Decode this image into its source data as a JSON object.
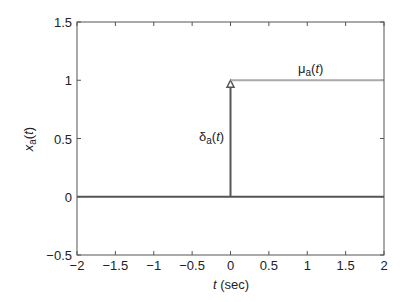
{
  "chart_data": {
    "type": "line",
    "title": "",
    "xlabel": "t (sec)",
    "xlabel_italic_part": "t",
    "xlabel_unit": " (sec)",
    "ylabel": "x_a(t)",
    "xlim": [
      -2,
      2
    ],
    "ylim": [
      -0.5,
      1.5
    ],
    "grid": false,
    "legend": null,
    "xticks": [
      -2,
      -1.5,
      -1,
      -0.5,
      0,
      0.5,
      1,
      1.5,
      2
    ],
    "xtick_labels": [
      "−2",
      "−1.5",
      "−1",
      "−0.5",
      "0",
      "0.5",
      "1",
      "1.5",
      "2"
    ],
    "yticks": [
      -0.5,
      0,
      0.5,
      1,
      1.5
    ],
    "ytick_labels": [
      "−0.5",
      "0",
      "0.5",
      "1",
      "1.5"
    ],
    "series": [
      {
        "name": "zero baseline",
        "color": "#555555",
        "x": [
          -2,
          2
        ],
        "y": [
          0,
          0
        ]
      },
      {
        "name": "delta_a(t) impulse",
        "color": "#555555",
        "style": "stem with triangle arrowhead",
        "x": [
          0,
          0
        ],
        "y": [
          0,
          1
        ]
      },
      {
        "name": "mu_a(t) step",
        "color": "#aaaaaa",
        "x": [
          0,
          2
        ],
        "y": [
          1,
          1
        ]
      }
    ],
    "annotations": [
      {
        "text": "δa(t)",
        "symbol": "δ",
        "subscript": "a",
        "arg": "(t)",
        "x": -0.28,
        "y": 0.57
      },
      {
        "text": "μa(t)",
        "symbol": "μ",
        "subscript": "a",
        "arg": "(t)",
        "x": 1.0,
        "y": 1.1
      }
    ]
  },
  "labels": {
    "x_italic": "t",
    "x_unit": " (sec)",
    "y_main": "x",
    "y_sub": "a",
    "y_arg_open": "(",
    "y_arg_var": "t",
    "y_arg_close": ")",
    "delta_symbol": "δ",
    "delta_sub": "a",
    "delta_arg_open": "(",
    "delta_arg_var": "t",
    "delta_arg_close": ")",
    "mu_symbol": "μ",
    "mu_sub": "a",
    "mu_arg_open": "(",
    "mu_arg_var": "t",
    "mu_arg_close": ")"
  }
}
